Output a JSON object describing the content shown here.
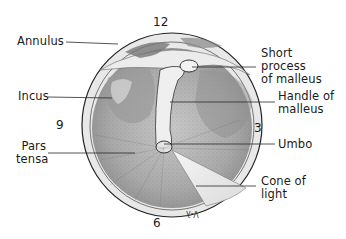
{
  "figure": {
    "clock_positions": {
      "top": "12",
      "right": "3",
      "bottom": "6",
      "left": "9"
    },
    "labels": {
      "annulus": "Annulus",
      "incus": "Incus",
      "pars_tensa_line1": "Pars",
      "pars_tensa_line2": "tensa",
      "short_process_line1": "Short",
      "short_process_line2": "process",
      "short_process_line3": "of malleus",
      "handle_line1": "Handle of",
      "handle_line2": "malleus",
      "umbo": "Umbo",
      "cone_line1": "Cone of",
      "cone_line2": "light"
    },
    "signature": "V-λ",
    "colors": {
      "line": "#2a2a2a",
      "membrane": "#b9b9b9",
      "annulus_ring": "#e6e6e6",
      "highlight": "#f2f2f2"
    }
  }
}
